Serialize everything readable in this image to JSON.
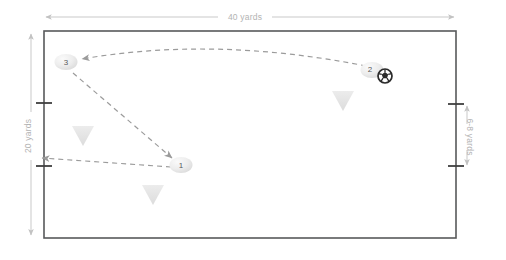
{
  "diagram": {
    "field": {
      "name": "playing-area",
      "x": 44,
      "y": 31,
      "width": 412,
      "height": 207,
      "border_color": "#58595b",
      "fill_color": "#ffffff"
    },
    "dimensions": [
      {
        "id": "width-dimension",
        "label": "40 yards",
        "orientation": "horizontal",
        "value": 40,
        "unit": "yards",
        "position": "top"
      },
      {
        "id": "height-dimension",
        "label": "20 yards",
        "orientation": "vertical",
        "value": 20,
        "unit": "yards",
        "position": "left"
      },
      {
        "id": "gate-dimension",
        "label": "6-8 yards",
        "orientation": "vertical",
        "value": "6-8",
        "unit": "yards",
        "position": "right"
      }
    ],
    "players": [
      {
        "id": "player-3",
        "label": "3",
        "cx": 66,
        "cy": 62
      },
      {
        "id": "player-2",
        "label": "2",
        "cx": 372,
        "cy": 70
      },
      {
        "id": "player-1",
        "label": "1",
        "cx": 181,
        "cy": 165
      }
    ],
    "ball": {
      "id": "soccer-ball",
      "cx": 385,
      "cy": 76,
      "r": 7,
      "color": "#2b2b2b"
    },
    "cones": [
      {
        "id": "cone-left",
        "cx": 83,
        "cy": 135
      },
      {
        "id": "cone-bottom",
        "cx": 153,
        "cy": 194
      },
      {
        "id": "cone-right",
        "cx": 343,
        "cy": 100
      }
    ],
    "arrows": [
      {
        "id": "pass-arrow-2-to-3",
        "kind": "pass",
        "from": "player-2",
        "to": "player-3",
        "style": "dashed-curved"
      },
      {
        "id": "run-arrow-3-to-1",
        "kind": "run",
        "from": "player-3",
        "to": "player-1",
        "style": "dashed-straight"
      },
      {
        "id": "pass-arrow-1-to-gate",
        "kind": "pass",
        "from": "player-1",
        "to": "left-gate",
        "style": "dashed-straight"
      }
    ],
    "gate_ticks": [
      {
        "id": "left-gate-tick-top",
        "x": 44,
        "y": 103
      },
      {
        "id": "left-gate-tick-bottom",
        "x": 44,
        "y": 166
      },
      {
        "id": "right-gate-tick-top",
        "x": 456,
        "y": 104
      },
      {
        "id": "right-gate-tick-bottom",
        "x": 456,
        "y": 166
      }
    ],
    "colors": {
      "field_border": "#58595b",
      "dimension_line": "#c9c9c9",
      "dimension_text": "#b3b3b3",
      "arrow": "#9b9b9b",
      "player_fill": "#e8e8e8",
      "player_text": "#58595b",
      "cone_fill": "#e4e4e4",
      "ball": "#2b2b2b"
    }
  }
}
